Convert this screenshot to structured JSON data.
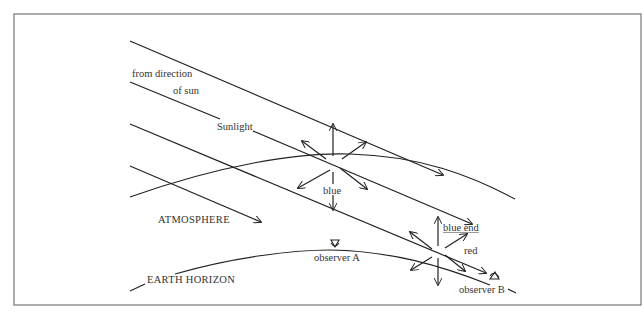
{
  "diagram": {
    "labels": {
      "from_direction": "from direction",
      "of_sun": "of sun",
      "sunlight": "Sunlight",
      "blue": "blue",
      "atmosphere": "ATMOSPHERE",
      "blue_end": "blue end",
      "red": "red",
      "observer_a": "observer A",
      "earth_horizon": "EARTH HORIZON",
      "observer_b": "observer B"
    },
    "colors": {
      "line": "#222222",
      "frame": "#777777",
      "text": "#333333",
      "background": "#ffffff"
    }
  }
}
